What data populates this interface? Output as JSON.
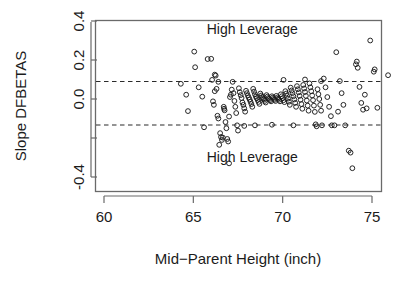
{
  "chart_data": {
    "type": "scatter",
    "title": "",
    "xlabel": "Mid−Parent Height (inch)",
    "ylabel": "Slope DFBETAS",
    "xlim": [
      58.8,
      76.5
    ],
    "ylim": [
      -0.46,
      0.44
    ],
    "grid": false,
    "legend": null,
    "xticks": [
      60,
      65,
      70,
      75
    ],
    "xtick_labels": [
      "60",
      "65",
      "70",
      "75"
    ],
    "yticks": [
      -0.4,
      -0.2,
      0.0,
      0.2,
      0.4
    ],
    "ytick_labels": [
      "-0.4",
      "",
      "0.0",
      "0.2",
      "0.4"
    ],
    "ytick_labels_shown": [
      "0.4",
      "0.2",
      "0.0",
      "-0.4"
    ],
    "annotations": [
      {
        "text": "High Leverage",
        "x": 68.3,
        "y": 0.335
      },
      {
        "text": "High Leverage",
        "x": 68.3,
        "y": -0.325
      }
    ],
    "reference_lines": [
      {
        "orientation": "horizontal",
        "value": 0.09,
        "style": "dashed"
      },
      {
        "orientation": "horizontal",
        "value": -0.133,
        "style": "dashed"
      }
    ],
    "marker": {
      "shape": "open-circle",
      "radius": 2.4,
      "color": "#1b1b1b"
    },
    "points": [
      [
        64.3,
        0.078
      ],
      [
        64.6,
        0.022
      ],
      [
        64.7,
        -0.062
      ],
      [
        65.05,
        0.243
      ],
      [
        65.1,
        0.163
      ],
      [
        65.3,
        0.06
      ],
      [
        65.5,
        0.012
      ],
      [
        65.8,
        0.205
      ],
      [
        66.0,
        0.206
      ],
      [
        66.05,
        0.098
      ],
      [
        66.1,
        -0.012
      ],
      [
        66.15,
        -0.03
      ],
      [
        66.2,
        0.04
      ],
      [
        66.25,
        0.12
      ],
      [
        66.3,
        0.052
      ],
      [
        66.35,
        -0.086
      ],
      [
        66.4,
        -0.1
      ],
      [
        66.45,
        -0.235
      ],
      [
        66.5,
        -0.175
      ],
      [
        66.55,
        -0.195
      ],
      [
        66.6,
        -0.21
      ],
      [
        66.65,
        -0.198
      ],
      [
        66.7,
        -0.04
      ],
      [
        66.72,
        -0.05
      ],
      [
        66.75,
        -0.058
      ],
      [
        66.8,
        -0.118
      ],
      [
        66.85,
        -0.15
      ],
      [
        66.9,
        -0.205
      ],
      [
        66.95,
        -0.218
      ],
      [
        67.0,
        -0.09
      ],
      [
        67.05,
        0.01
      ],
      [
        67.1,
        0.022
      ],
      [
        67.15,
        0.048
      ],
      [
        67.2,
        0.088
      ],
      [
        67.25,
        0.03
      ],
      [
        67.3,
        -0.01
      ],
      [
        67.35,
        -0.04
      ],
      [
        67.4,
        -0.072
      ],
      [
        67.45,
        -0.135
      ],
      [
        67.5,
        -0.162
      ],
      [
        67.55,
        0.055
      ],
      [
        67.6,
        0.035
      ],
      [
        67.65,
        0.02
      ],
      [
        67.7,
        0.005
      ],
      [
        67.75,
        -0.018
      ],
      [
        67.8,
        -0.03
      ],
      [
        67.85,
        -0.048
      ],
      [
        67.9,
        -0.065
      ],
      [
        67.95,
        0.042
      ],
      [
        68.0,
        0.03
      ],
      [
        68.05,
        0.018
      ],
      [
        68.1,
        0.008
      ],
      [
        68.15,
        -0.002
      ],
      [
        68.2,
        -0.014
      ],
      [
        68.25,
        -0.026
      ],
      [
        68.3,
        -0.04
      ],
      [
        68.35,
        0.052
      ],
      [
        68.4,
        0.038
      ],
      [
        68.45,
        0.024
      ],
      [
        68.5,
        0.012
      ],
      [
        68.55,
        0.004
      ],
      [
        68.6,
        -0.005
      ],
      [
        68.65,
        -0.015
      ],
      [
        68.7,
        -0.025
      ],
      [
        68.75,
        0.028
      ],
      [
        68.8,
        0.018
      ],
      [
        68.85,
        0.01
      ],
      [
        68.9,
        0.003
      ],
      [
        68.95,
        -0.003
      ],
      [
        69.0,
        -0.01
      ],
      [
        69.05,
        -0.018
      ],
      [
        69.1,
        0.02
      ],
      [
        69.15,
        0.012
      ],
      [
        69.2,
        0.005
      ],
      [
        69.25,
        0.0
      ],
      [
        69.3,
        -0.006
      ],
      [
        69.35,
        -0.012
      ],
      [
        69.4,
        0.014
      ],
      [
        69.45,
        0.007
      ],
      [
        69.5,
        0.001
      ],
      [
        69.55,
        -0.004
      ],
      [
        69.6,
        -0.01
      ],
      [
        69.65,
        0.016
      ],
      [
        69.7,
        0.008
      ],
      [
        69.75,
        0.002
      ],
      [
        69.8,
        -0.004
      ],
      [
        69.85,
        -0.012
      ],
      [
        69.9,
        0.024
      ],
      [
        69.95,
        0.014
      ],
      [
        70.0,
        0.004
      ],
      [
        70.05,
        -0.006
      ],
      [
        70.1,
        -0.016
      ],
      [
        70.15,
        0.04
      ],
      [
        70.2,
        0.028
      ],
      [
        70.25,
        0.016
      ],
      [
        70.3,
        0.002
      ],
      [
        70.35,
        -0.014
      ],
      [
        70.4,
        -0.03
      ],
      [
        70.45,
        0.058
      ],
      [
        70.5,
        0.044
      ],
      [
        70.55,
        0.03
      ],
      [
        70.6,
        0.014
      ],
      [
        70.65,
        -0.002
      ],
      [
        70.7,
        -0.02
      ],
      [
        70.75,
        -0.04
      ],
      [
        70.8,
        0.066
      ],
      [
        70.85,
        0.05
      ],
      [
        70.9,
        0.034
      ],
      [
        70.95,
        0.016
      ],
      [
        71.0,
        -0.004
      ],
      [
        71.05,
        -0.026
      ],
      [
        71.1,
        -0.05
      ],
      [
        71.15,
        0.072
      ],
      [
        71.2,
        0.054
      ],
      [
        71.25,
        0.036
      ],
      [
        71.3,
        0.016
      ],
      [
        71.35,
        -0.008
      ],
      [
        71.4,
        -0.034
      ],
      [
        71.45,
        -0.06
      ],
      [
        71.5,
        0.08
      ],
      [
        71.55,
        0.06
      ],
      [
        71.6,
        0.04
      ],
      [
        71.65,
        0.018
      ],
      [
        71.7,
        -0.006
      ],
      [
        71.75,
        -0.034
      ],
      [
        71.8,
        -0.066
      ],
      [
        71.85,
        -0.13
      ],
      [
        71.9,
        -0.14
      ],
      [
        71.95,
        0.05
      ],
      [
        72.0,
        0.025
      ],
      [
        72.05,
        0.0
      ],
      [
        72.1,
        -0.03
      ],
      [
        72.15,
        -0.06
      ],
      [
        72.2,
        -0.135
      ],
      [
        72.3,
        0.105
      ],
      [
        72.4,
        0.06
      ],
      [
        72.5,
        0.01
      ],
      [
        72.6,
        -0.04
      ],
      [
        72.7,
        -0.088
      ],
      [
        72.75,
        -0.135
      ],
      [
        72.9,
        -0.135
      ],
      [
        73.0,
        0.24
      ],
      [
        73.2,
        0.092
      ],
      [
        73.3,
        0.03
      ],
      [
        73.4,
        -0.03
      ],
      [
        73.5,
        -0.135
      ],
      [
        73.7,
        -0.265
      ],
      [
        73.8,
        -0.275
      ],
      [
        73.9,
        -0.355
      ],
      [
        74.1,
        0.178
      ],
      [
        74.15,
        0.192
      ],
      [
        74.2,
        0.16
      ],
      [
        74.3,
        0.062
      ],
      [
        74.4,
        -0.02
      ],
      [
        74.5,
        -0.055
      ],
      [
        74.6,
        0.022
      ],
      [
        74.7,
        -0.048
      ],
      [
        74.9,
        0.3
      ],
      [
        75.1,
        0.14
      ],
      [
        75.15,
        0.152
      ],
      [
        75.3,
        -0.045
      ],
      [
        75.9,
        0.122
      ],
      [
        67.0,
        -0.33
      ],
      [
        66.2,
        0.125
      ],
      [
        65.6,
        -0.145
      ],
      [
        66.4,
        0.088
      ],
      [
        70.05,
        0.098
      ],
      [
        71.25,
        0.1
      ],
      [
        72.15,
        0.092
      ],
      [
        73.1,
        -0.065
      ],
      [
        70.6,
        -0.135
      ],
      [
        69.4,
        -0.132
      ],
      [
        68.45,
        -0.135
      ],
      [
        67.85,
        -0.138
      ]
    ]
  },
  "axis_titles": {
    "x": "Mid−Parent Height (inch)",
    "y": "Slope DFBETAS"
  },
  "annotation_labels": {
    "upper": "High Leverage",
    "lower": "High Leverage"
  },
  "colors": {
    "background": "#ffffff",
    "axis": "#6a6a6a",
    "marker": "#1b1b1b",
    "dashed_line": "#2b2b2b",
    "text": "#1b1b1b"
  }
}
